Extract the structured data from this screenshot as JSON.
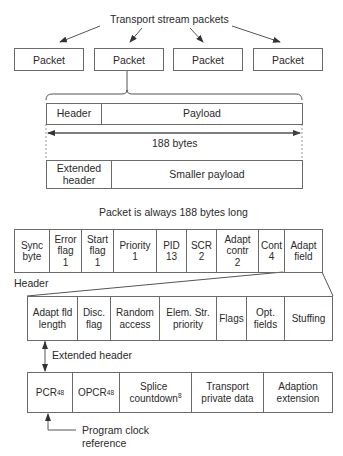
{
  "title": "Transport stream packets",
  "packets": [
    "Packet",
    "Packet",
    "Packet",
    "Packet"
  ],
  "packet_structure": {
    "header": "Header",
    "payload": "Payload",
    "size_label": "188 bytes",
    "extended_header": "Extended\nheader",
    "smaller_payload": "Smaller payload",
    "caption": "Packet is always 188 bytes long"
  },
  "header_fields": [
    {
      "label": "Sync\nbyte"
    },
    {
      "label": "Error\nflag\n1"
    },
    {
      "label": "Start\nflag\n1"
    },
    {
      "label": "Priority\n1"
    },
    {
      "label": "PID\n13"
    },
    {
      "label": "SCR\n2"
    },
    {
      "label": "Adapt\ncontr\n2"
    },
    {
      "label": "Cont\n4"
    },
    {
      "label": "Adapt\nfield"
    }
  ],
  "header_label": "Header",
  "adaptation_fields": [
    {
      "label": "Adapt fld\nlength"
    },
    {
      "label": "Disc.\nflag"
    },
    {
      "label": "Random\naccess"
    },
    {
      "label": "Elem. Str.\npriority"
    },
    {
      "label": "Flags"
    },
    {
      "label": "Opt.\nfields"
    },
    {
      "label": "Stuffing"
    }
  ],
  "extended_header_label": "Extended header",
  "optional_fields": [
    {
      "label": "PCR",
      "sub": "48"
    },
    {
      "label": "OPCR",
      "sub": "48"
    },
    {
      "label": "Splice\ncountdown",
      "sub": "8"
    },
    {
      "label": "Transport\nprivate data",
      "sub": ""
    },
    {
      "label": "Adaption\nextension",
      "sub": ""
    }
  ],
  "pcr_note": "Program clock\nreference"
}
